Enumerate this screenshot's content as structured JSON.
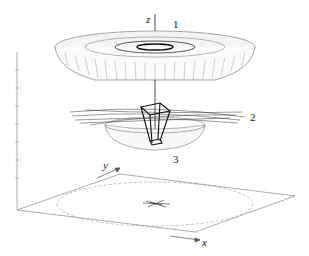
{
  "diagram": {
    "type": "3d-wireframe-surface",
    "axes": {
      "x": "x",
      "y": "y",
      "z": "z"
    },
    "labels": {
      "surface_1": "1",
      "surface_2": "2",
      "surface_3": "3"
    },
    "colors": {
      "line": "#333333",
      "dark": "#111111",
      "light": "#888888"
    }
  }
}
